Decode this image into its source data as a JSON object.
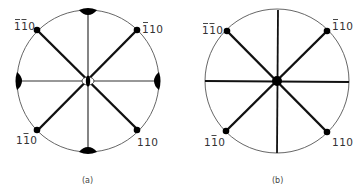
{
  "figure": {
    "panels": [
      {
        "id": "a",
        "caption": "(a)",
        "center_marker": "lens-shaped twofold axis (open ellipse with filled center)",
        "edge_markers": "filled lens (twofold axis) at top, bottom, left, right",
        "poles": [
          {
            "position": "top-left",
            "label": "110",
            "bars": [
              0,
              1
            ],
            "label_display": "1̄1̄0"
          },
          {
            "position": "top-right",
            "label": "110",
            "bars": [
              0
            ],
            "label_display": "1̄10"
          },
          {
            "position": "bottom-left",
            "label": "110",
            "bars": [
              1
            ],
            "label_display": "11̄0"
          },
          {
            "position": "bottom-right",
            "label": "110",
            "bars": [],
            "label_display": "110"
          }
        ]
      },
      {
        "id": "b",
        "caption": "(b)",
        "center_marker": "filled circle",
        "edge_markers": "none",
        "poles": [
          {
            "position": "top-left",
            "label": "110",
            "bars": [
              0,
              1
            ],
            "label_display": "1̄1̄0"
          },
          {
            "position": "top-right",
            "label": "110",
            "bars": [
              0
            ],
            "label_display": "1̄10"
          },
          {
            "position": "bottom-left",
            "label": "110",
            "bars": [
              1
            ],
            "label_display": "11̄0"
          },
          {
            "position": "bottom-right",
            "label": "110",
            "bars": [],
            "label_display": "110"
          }
        ]
      }
    ],
    "colors": {
      "line": "#111111",
      "outline": "#555555",
      "text": "#333333",
      "background": "#ffffff"
    }
  }
}
